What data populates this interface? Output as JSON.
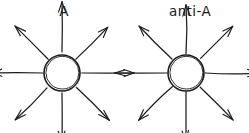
{
  "figure": {
    "title": "",
    "background_color": "#ffffff",
    "stroke_color": "#1c1c1c",
    "label_color": "#1a1a1a",
    "width": 249,
    "height": 133
  },
  "panels": [
    {
      "id": "panel-a",
      "label": "A",
      "label_x": 64,
      "label_y": 16,
      "center_x": 62,
      "center_y": 73,
      "circle_radius": 18,
      "arrow_direction": "outward",
      "ray_count": 8,
      "ray_inner_radius": 20,
      "ray_outer_radius": 52,
      "rays": [
        {
          "name": "ray-up",
          "angle_deg": 270,
          "length": 50
        },
        {
          "name": "ray-up-right",
          "angle_deg": 315,
          "length": 46
        },
        {
          "name": "ray-right",
          "angle_deg": 0,
          "length": 52
        },
        {
          "name": "ray-down-right",
          "angle_deg": 45,
          "length": 46
        },
        {
          "name": "ray-down",
          "angle_deg": 90,
          "length": 50
        },
        {
          "name": "ray-down-left",
          "angle_deg": 135,
          "length": 46
        },
        {
          "name": "ray-left",
          "angle_deg": 180,
          "length": 52
        },
        {
          "name": "ray-up-left",
          "angle_deg": 225,
          "length": 46
        }
      ]
    },
    {
      "id": "panel-anti-a",
      "label": "anti-A",
      "label_x": 190,
      "label_y": 16,
      "center_x": 186,
      "center_y": 73,
      "circle_radius": 18,
      "arrow_direction": "outward",
      "ray_count": 8,
      "ray_inner_radius": 20,
      "ray_outer_radius": 52,
      "rays": [
        {
          "name": "ray-up",
          "angle_deg": 270,
          "length": 50
        },
        {
          "name": "ray-up-right",
          "angle_deg": 315,
          "length": 46
        },
        {
          "name": "ray-right",
          "angle_deg": 0,
          "length": 52
        },
        {
          "name": "ray-down-right",
          "angle_deg": 45,
          "length": 46
        },
        {
          "name": "ray-down",
          "angle_deg": 90,
          "length": 50
        },
        {
          "name": "ray-down-left",
          "angle_deg": 135,
          "length": 46
        },
        {
          "name": "ray-left",
          "angle_deg": 180,
          "length": 52
        },
        {
          "name": "ray-up-left",
          "angle_deg": 225,
          "length": 46
        }
      ]
    }
  ]
}
